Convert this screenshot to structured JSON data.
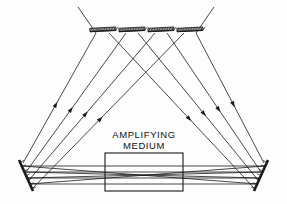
{
  "figure": {
    "background_color": "#fdfdfd",
    "line_color": "#1a1a1a",
    "width": 287,
    "height": 204
  },
  "labels": {
    "medium_line1": "AMPLIFYING",
    "medium_line2": "MEDIUM"
  },
  "components": {
    "amplifying_medium_box": {
      "name": "amplifying-medium-box",
      "x": 105,
      "y": 153,
      "width": 78,
      "height": 38,
      "stroke": "#1a1a1a"
    },
    "left_end_mirror": {
      "name": "left-end-mirror",
      "x1": 19,
      "y1": 160,
      "x2": 33,
      "y2": 191,
      "hatched": true
    },
    "right_end_mirror": {
      "name": "right-end-mirror",
      "x1": 268,
      "y1": 160,
      "x2": 254,
      "y2": 191,
      "hatched": true
    },
    "top_fold_mirrors": [
      {
        "name": "top-fold-mirror-1",
        "cx": 103,
        "cy": 31,
        "length": 26,
        "tilt": -3
      },
      {
        "name": "top-fold-mirror-2",
        "cx": 132,
        "cy": 31,
        "length": 26,
        "tilt": -3
      },
      {
        "name": "top-fold-mirror-3",
        "cx": 161,
        "cy": 31,
        "length": 26,
        "tilt": -3
      },
      {
        "name": "top-fold-mirror-4",
        "cx": 190,
        "cy": 31,
        "length": 26,
        "tilt": -3
      }
    ]
  },
  "beam_paths": {
    "description": "Rays fan from the left end mirror, cross a waist inside the amplifying medium, reflect off the top fold mirrors, and return to the right end mirror.",
    "horizontal_passes": [
      {
        "name": "pass-h-1",
        "x1": 22,
        "y1": 166,
        "x2": 265,
        "y2": 166
      },
      {
        "name": "pass-h-2",
        "x1": 24,
        "y1": 172,
        "x2": 263,
        "y2": 172
      },
      {
        "name": "pass-h-3",
        "x1": 26,
        "y1": 178,
        "x2": 261,
        "y2": 178
      },
      {
        "name": "pass-h-4",
        "x1": 29,
        "y1": 184,
        "x2": 258,
        "y2": 184
      }
    ],
    "crossing_passes": [
      {
        "name": "pass-x-1",
        "x1": 22,
        "y1": 166,
        "x2": 258,
        "y2": 184
      },
      {
        "name": "pass-x-2",
        "x1": 24,
        "y1": 172,
        "x2": 261,
        "y2": 178
      },
      {
        "name": "pass-x-3",
        "x1": 26,
        "y1": 178,
        "x2": 263,
        "y2": 172
      },
      {
        "name": "pass-x-4",
        "x1": 29,
        "y1": 184,
        "x2": 265,
        "y2": 166
      }
    ],
    "left_up_rays": [
      {
        "name": "ray-left-up-1",
        "x1": 23,
        "y1": 163,
        "x2": 96,
        "y2": 33,
        "arrow_t": 0.45
      },
      {
        "name": "ray-left-up-2",
        "x1": 26,
        "y1": 172,
        "x2": 126,
        "y2": 33,
        "arrow_t": 0.45
      },
      {
        "name": "ray-left-up-3",
        "x1": 29,
        "y1": 180,
        "x2": 155,
        "y2": 33,
        "arrow_t": 0.45
      },
      {
        "name": "ray-left-up-4",
        "x1": 32,
        "y1": 189,
        "x2": 184,
        "y2": 33,
        "arrow_t": 0.45
      }
    ],
    "right_up_rays": [
      {
        "name": "ray-right-up-1",
        "x1": 264,
        "y1": 163,
        "x2": 196,
        "y2": 33,
        "arrow_t": 0.45
      },
      {
        "name": "ray-right-up-2",
        "x1": 261,
        "y1": 172,
        "x2": 167,
        "y2": 33,
        "arrow_t": 0.45
      },
      {
        "name": "ray-right-up-3",
        "x1": 258,
        "y1": 180,
        "x2": 138,
        "y2": 33,
        "arrow_t": 0.45
      },
      {
        "name": "ray-right-up-4",
        "x1": 255,
        "y1": 189,
        "x2": 109,
        "y2": 33,
        "arrow_t": 0.45
      }
    ],
    "outer_extensions": [
      {
        "name": "ray-ext-left",
        "x1": 96,
        "y1": 33,
        "x2": 78,
        "y2": 7
      },
      {
        "name": "ray-ext-right",
        "x1": 196,
        "y1": 33,
        "x2": 214,
        "y2": 7
      }
    ]
  }
}
